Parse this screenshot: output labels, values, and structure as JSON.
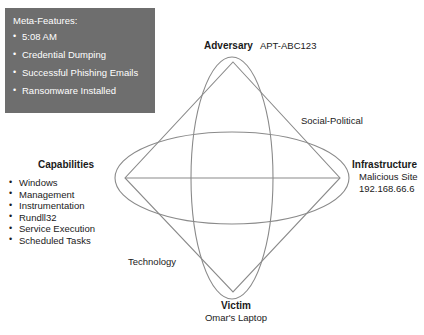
{
  "diagram": {
    "type": "diamond-model",
    "meta_panel": {
      "title": "Meta-Features:",
      "items": [
        "5:08 AM",
        "Credential Dumping",
        "Successful Phishing Emails",
        "Ransomware Installed"
      ],
      "background_color": "#6e6e6e",
      "text_color": "#ffffff"
    },
    "vertices": {
      "adversary": {
        "label": "Adversary",
        "value": "APT-ABC123"
      },
      "infrastructure": {
        "label": "Infrastructure",
        "value_line1": "Malicious Site",
        "value_line2": "192.168.66.6"
      },
      "capabilities": {
        "label": "Capabilities",
        "items": [
          "Windows",
          "Management",
          "Instrumentation",
          "Rundll32",
          "Service Execution",
          "Scheduled Tasks"
        ]
      },
      "victim": {
        "label": "Victim",
        "value": "Omar's Laptop"
      }
    },
    "axes": {
      "social_political": "Social-Political",
      "technology": "Technology"
    },
    "colors": {
      "stroke": "#8a8a8a",
      "text": "#1a1a1a",
      "background": "#ffffff"
    }
  }
}
